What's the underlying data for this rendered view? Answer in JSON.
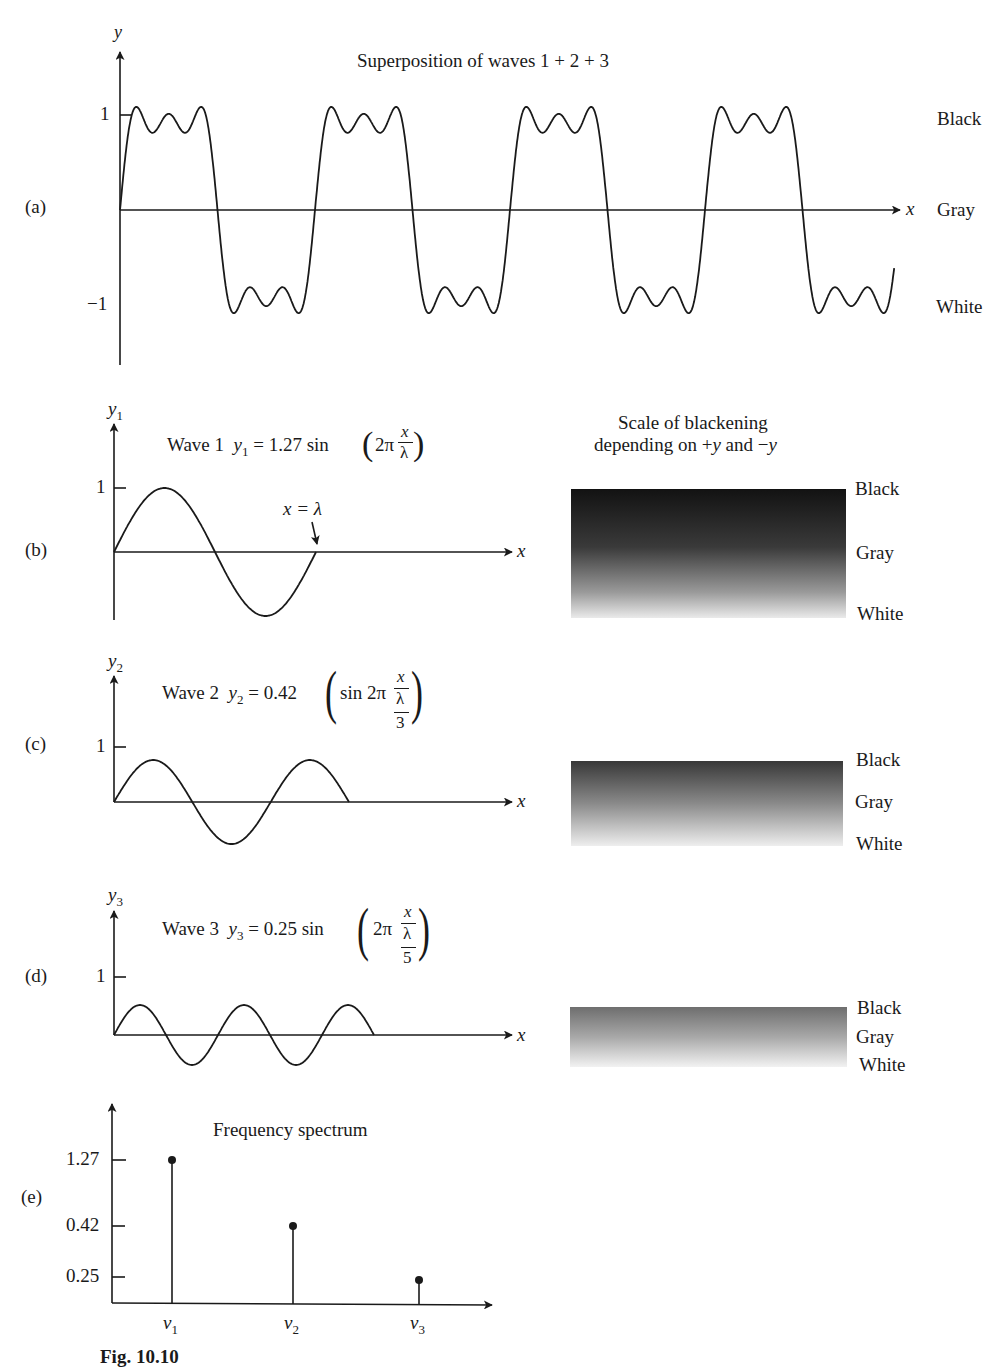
{
  "figure": {
    "caption": "Fig. 10.10",
    "panels": {
      "a": {
        "label": "(a)",
        "title": "Superposition of waves 1 + 2 + 3",
        "y_axis": "y",
        "x_axis": "x",
        "ticks": [
          "1",
          "−1"
        ],
        "side_labels": [
          "Black",
          "Gray",
          "White"
        ]
      },
      "b": {
        "label": "(b)",
        "y_axis": "y",
        "y_sub": "1",
        "x_axis": "x",
        "wave_name": "Wave 1",
        "eq_lhs_var": "y",
        "eq_lhs_sub": "1",
        "eq_rhs": "= 1.27 sin",
        "eq_inner": "2π",
        "eq_num": "x",
        "eq_den": "λ",
        "tick": "1",
        "annotation": "x = λ"
      },
      "c": {
        "label": "(c)",
        "y_axis": "y",
        "y_sub": "2",
        "x_axis": "x",
        "wave_name": "Wave 2",
        "eq_lhs_var": "y",
        "eq_lhs_sub": "2",
        "eq_rhs": "= 0.42",
        "eq_inner": "sin 2π",
        "eq_num": "x",
        "eq_den": "λ",
        "eq_den2": "3",
        "tick": "1"
      },
      "d": {
        "label": "(d)",
        "y_axis": "y",
        "y_sub": "3",
        "x_axis": "x",
        "wave_name": "Wave 3",
        "eq_lhs_var": "y",
        "eq_lhs_sub": "3",
        "eq_rhs": "= 0.25 sin",
        "eq_inner": "2π",
        "eq_num": "x",
        "eq_den": "λ",
        "eq_den2": "5",
        "tick": "1"
      },
      "e": {
        "label": "(e)",
        "title": "Frequency spectrum",
        "ticks": [
          "1.27",
          "0.42",
          "0.25"
        ],
        "x_ticks": [
          "ν",
          "ν",
          "ν"
        ],
        "x_subs": [
          "1",
          "2",
          "3"
        ]
      }
    },
    "blackening_scale": {
      "title_line1": "Scale of blackening",
      "title_line2_pre": "depending on +",
      "title_line2_y1": "y",
      "title_line2_mid": " and −",
      "title_line2_y2": "y",
      "bars": [
        {
          "labels": [
            "Black",
            "Gray",
            "White"
          ],
          "top_color": "#141414",
          "bottom_color": "#e8e8e8"
        },
        {
          "labels": [
            "Black",
            "Gray",
            "White"
          ],
          "top_color": "#3a3a3a",
          "bottom_color": "#ececec"
        },
        {
          "labels": [
            "Black",
            "Gray",
            "White"
          ],
          "top_color": "#6a6a6a",
          "bottom_color": "#f0f0f0"
        }
      ]
    }
  },
  "chart_data": [
    {
      "type": "line",
      "title": "Superposition of waves 1 + 2 + 3",
      "xlabel": "x",
      "ylabel": "y",
      "ylim": [
        -1.3,
        1.4
      ],
      "function": "y = 1.27 sin(2πx/λ) + 0.42 sin(6πx/λ) + 0.25 sin(10πx/λ)",
      "x_range_wavelengths": [
        0,
        4
      ],
      "y_ticks": [
        1,
        -1
      ],
      "annotations": [
        "Black (y=+1)",
        "Gray (y=0)",
        "White (y=-1)"
      ]
    },
    {
      "type": "line",
      "title": "Wave 1 y1 = 1.27 sin(2π x/λ)",
      "xlabel": "x",
      "ylabel": "y1",
      "amplitude": 1.27,
      "wavelength_fraction": 1,
      "x_range_wavelengths": [
        0,
        1
      ],
      "y_ticks": [
        1
      ],
      "annotations": [
        "x = λ"
      ]
    },
    {
      "type": "line",
      "title": "Wave 2 y2 = 0.42 (sin 2π x/(λ/3))",
      "xlabel": "x",
      "ylabel": "y2",
      "amplitude": 0.42,
      "wavelength_fraction": 0.3333,
      "x_range_wavelengths": [
        0,
        0.5
      ],
      "y_ticks": [
        1
      ]
    },
    {
      "type": "line",
      "title": "Wave 3 y3 = 0.25 sin(2π x/(λ/5))",
      "xlabel": "x",
      "ylabel": "y3",
      "amplitude": 0.25,
      "wavelength_fraction": 0.2,
      "x_range_wavelengths": [
        0,
        0.5
      ],
      "y_ticks": [
        1
      ]
    },
    {
      "type": "bar",
      "title": "Frequency spectrum",
      "categories": [
        "ν1",
        "ν2",
        "ν3"
      ],
      "values": [
        1.27,
        0.42,
        0.25
      ],
      "xlabel": "",
      "ylabel": "",
      "y_ticks": [
        1.27,
        0.42,
        0.25
      ],
      "style": "stem"
    }
  ]
}
